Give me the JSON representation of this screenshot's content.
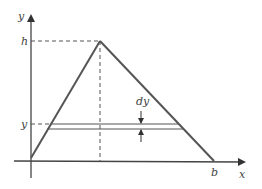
{
  "diagram": {
    "type": "triangle-area-strip",
    "labels": {
      "y_axis": "y",
      "x_axis": "x",
      "height": "h",
      "strip_y": "y",
      "strip_thickness": "dy",
      "base": "b"
    },
    "colors": {
      "line": "#555555",
      "background": "#ffffff"
    }
  }
}
